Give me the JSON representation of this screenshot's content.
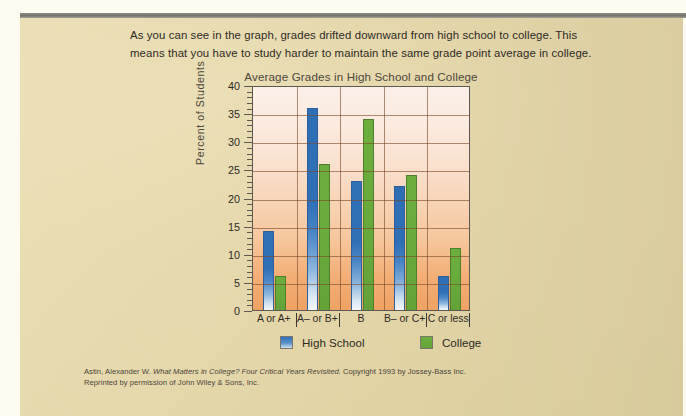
{
  "page": {
    "body_text": "As you can see in the graph, grades drifted downward from high school to college. This means that you have to study harder to maintain the same grade point average in college.",
    "citation_line1_prefix": "Astin, Alexander W. ",
    "citation_line1_italic": "What Matters in College? Four Critical Years Revisited.",
    "citation_line1_suffix": " Copyright 1993 by Jossey-Bass Inc.",
    "citation_line2": "Reprinted by permission of John Wiley & Sons, Inc."
  },
  "colors": {
    "high_school": "#2f6fb6",
    "college": "#6cae3e",
    "page_tan": "#e7d9ab",
    "plot_top": "#fbf0e9",
    "plot_bottom": "#efa263",
    "gridline": "#7a4a2a",
    "top_rule": "#8d8a86"
  },
  "chart_data": {
    "type": "bar",
    "title": "Average Grades in High School and College",
    "xlabel": "",
    "ylabel": "Percent of  Students",
    "categories": [
      "A or A+",
      "A– or B+",
      "B",
      "B– or C+",
      "C or less"
    ],
    "series": [
      {
        "name": "High School",
        "values": [
          14,
          36,
          23,
          22,
          6
        ]
      },
      {
        "name": "College",
        "values": [
          6,
          26,
          34,
          24,
          11
        ]
      }
    ],
    "ylim": [
      0,
      40
    ],
    "ytick_labels": [
      "0",
      "5",
      "10",
      "15",
      "20",
      "25",
      "30",
      "35",
      "40"
    ],
    "ytick_step": 5,
    "minor_tick_step": 1,
    "grid": true,
    "legend_position": "bottom"
  }
}
